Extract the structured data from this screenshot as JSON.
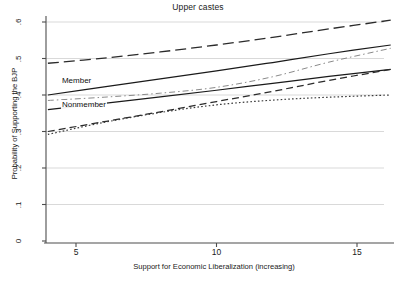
{
  "chart_data": {
    "type": "line",
    "title": "Upper castes",
    "xlabel": "Support for Economic Liberalization (increasing)",
    "ylabel": "Probability of Supporting the BJP",
    "xlim": [
      3.2,
      16.6
    ],
    "ylim": [
      0,
      0.63
    ],
    "xticks": [
      5,
      10,
      15
    ],
    "xtick_labels": [
      "5",
      "10",
      "15"
    ],
    "yticks": [
      0,
      0.1,
      0.2,
      0.3,
      0.4,
      0.5,
      0.6
    ],
    "ytick_labels": [
      "0",
      ".1",
      ".2",
      ".3",
      ".4",
      ".5",
      ".6"
    ],
    "grid": "horizontal",
    "grid_color": "#d9d9d9",
    "legend": "none",
    "annotations": [
      {
        "text": "Member",
        "x": 4.5,
        "y": 0.435
      },
      {
        "text": "Nonmember",
        "x": 4.5,
        "y": 0.37
      }
    ],
    "series": [
      {
        "name": "series-1-long-dash-top",
        "style": "long-dashed",
        "color": "#2b2b2b",
        "x": [
          4.0,
          6.0,
          8.0,
          10.0,
          12.0,
          14.0,
          16.2
        ],
        "values": [
          0.487,
          0.501,
          0.518,
          0.537,
          0.558,
          0.581,
          0.605
        ]
      },
      {
        "name": "series-2-solid-member",
        "style": "solid",
        "color": "#1a1a1a",
        "x": [
          4.0,
          6.0,
          8.0,
          10.0,
          12.0,
          14.0,
          16.2
        ],
        "values": [
          0.4,
          0.422,
          0.444,
          0.466,
          0.489,
          0.513,
          0.537
        ]
      },
      {
        "name": "series-3-dash-dot-thin",
        "style": "dash-dot",
        "color": "#8a8a8a",
        "x": [
          4.0,
          6.0,
          8.0,
          10.0,
          12.0,
          14.0,
          16.2
        ],
        "values": [
          0.385,
          0.394,
          0.405,
          0.421,
          0.45,
          0.49,
          0.528
        ]
      },
      {
        "name": "series-4-solid-nonmember",
        "style": "solid",
        "color": "#1a1a1a",
        "x": [
          4.0,
          6.0,
          8.0,
          10.0,
          12.0,
          14.0,
          16.2
        ],
        "values": [
          0.36,
          0.377,
          0.395,
          0.413,
          0.432,
          0.451,
          0.47
        ]
      },
      {
        "name": "series-5-medium-dash",
        "style": "dashed",
        "color": "#2b2b2b",
        "x": [
          4.0,
          6.0,
          8.0,
          10.0,
          12.0,
          14.0,
          16.2
        ],
        "values": [
          0.3,
          0.327,
          0.354,
          0.382,
          0.41,
          0.44,
          0.47
        ]
      },
      {
        "name": "series-6-fine-dotted-flat",
        "style": "dotted",
        "color": "#3a3a3a",
        "x": [
          4.0,
          6.0,
          8.0,
          10.0,
          12.0,
          14.0,
          16.2
        ],
        "values": [
          0.292,
          0.325,
          0.352,
          0.373,
          0.386,
          0.394,
          0.4
        ]
      }
    ]
  },
  "figure": {
    "background": "#ffffff",
    "axis_color": "#4d4d4d"
  }
}
